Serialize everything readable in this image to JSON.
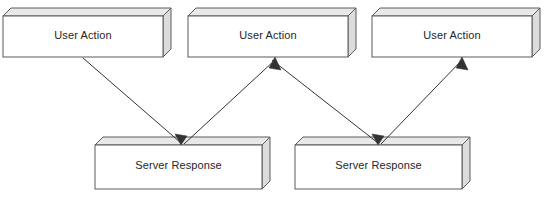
{
  "diagram": {
    "type": "flowchart",
    "background_color": "#ffffff",
    "style": {
      "box_front_fill": "#ffffff",
      "box_top_fill": "#e8e8e8",
      "box_side_fill": "#dcdcdc",
      "box_stroke": "#5a5a5a",
      "arrow_stroke": "#333333",
      "label_color": "#262626",
      "depth_px": 8
    },
    "nodes": [
      {
        "id": "user-action-1",
        "label": "User Action",
        "row": "top",
        "x": 3,
        "y": 16,
        "width": 160,
        "height": 41
      },
      {
        "id": "user-action-2",
        "label": "User Action",
        "row": "top",
        "x": 188,
        "y": 16,
        "width": 160,
        "height": 41
      },
      {
        "id": "user-action-3",
        "label": "User Action",
        "row": "top",
        "x": 372,
        "y": 16,
        "width": 160,
        "height": 41
      },
      {
        "id": "server-response-1",
        "label": "Server Response",
        "row": "bottom",
        "x": 95,
        "y": 145,
        "width": 167,
        "height": 44
      },
      {
        "id": "server-response-2",
        "label": "Server Response",
        "row": "bottom",
        "x": 295,
        "y": 145,
        "width": 167,
        "height": 44
      }
    ],
    "edges": [
      {
        "id": "edge-ua1-sr1",
        "from": "user-action-1",
        "to": "server-response-1",
        "direction": "down-right",
        "x1": 83,
        "y1": 58,
        "x2": 181,
        "y2": 144,
        "arrowhead": "end"
      },
      {
        "id": "edge-sr1-ua2",
        "from": "server-response-1",
        "to": "user-action-2",
        "direction": "up-right",
        "x1": 181,
        "y1": 144,
        "x2": 275,
        "y2": 58,
        "arrowhead": "end"
      },
      {
        "id": "edge-ua2-sr2",
        "from": "user-action-2",
        "to": "server-response-2",
        "direction": "down-right",
        "x1": 275,
        "y1": 58,
        "x2": 378,
        "y2": 144,
        "arrowhead": "end"
      },
      {
        "id": "edge-sr2-ua3",
        "from": "server-response-2",
        "to": "user-action-3",
        "direction": "up-right",
        "x1": 378,
        "y1": 144,
        "x2": 462,
        "y2": 58,
        "arrowhead": "end"
      }
    ]
  }
}
